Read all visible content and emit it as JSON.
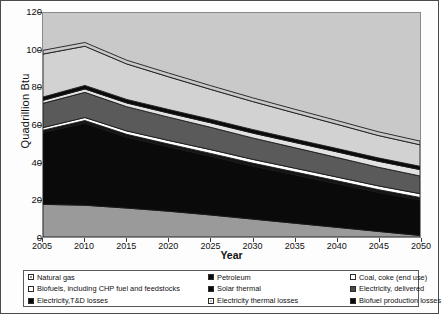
{
  "chart_data": {
    "type": "area",
    "stacked": true,
    "title": "",
    "xlabel": "Year",
    "ylabel": "Quadrillion Btu",
    "x": [
      2005,
      2010,
      2015,
      2020,
      2025,
      2030,
      2035,
      2040,
      2045,
      2050
    ],
    "xlim": [
      2005,
      2050
    ],
    "ylim": [
      0,
      120
    ],
    "ytick_values": [
      0,
      20,
      40,
      60,
      80,
      100,
      120
    ],
    "xtick_values": [
      2005,
      2010,
      2015,
      2020,
      2025,
      2030,
      2035,
      2040,
      2045,
      2050
    ],
    "grid": false,
    "legend_position": "below",
    "series": [
      {
        "name": "Natural gas",
        "color": "#9a9a9a",
        "values": [
          17.5,
          17.0,
          15.5,
          13.8,
          11.8,
          9.6,
          7.4,
          5.2,
          3.0,
          0.8
        ]
      },
      {
        "name": "Electricity,T&D losses",
        "color": "#0a0a0a",
        "values": [
          38.5,
          44.0,
          38.0,
          34.5,
          31.5,
          28.5,
          26.0,
          23.5,
          21.0,
          19.0
        ]
      },
      {
        "name": "Biofuel production losses",
        "color": "#141414",
        "values": [
          1.2,
          1.4,
          1.5,
          1.5,
          1.5,
          1.5,
          1.5,
          1.5,
          1.4,
          1.4
        ]
      },
      {
        "name": "Solar thermal",
        "color": "#ffffff",
        "values": [
          1.4,
          1.6,
          1.8,
          1.9,
          2.0,
          2.0,
          2.0,
          2.0,
          2.0,
          2.0
        ]
      },
      {
        "name": "Electricity thermal losses",
        "color": "#5a5a5a",
        "values": [
          13.0,
          13.5,
          13.0,
          12.5,
          12.0,
          11.5,
          11.0,
          10.5,
          10.0,
          9.5
        ]
      },
      {
        "name": "Biofuels, including CHP fuel and feedstocks",
        "color": "#e2e2e2",
        "values": [
          1.6,
          1.8,
          2.0,
          2.2,
          2.4,
          2.6,
          2.8,
          3.0,
          3.2,
          3.4
        ]
      },
      {
        "name": "Coal, coke (end use)",
        "color": "#0a0a0a",
        "values": [
          1.8,
          1.9,
          1.9,
          1.9,
          1.9,
          1.9,
          1.8,
          1.8,
          1.8,
          1.8
        ]
      },
      {
        "name": "Petroleum",
        "color": "#d2d2d2",
        "values": [
          23.0,
          21.0,
          19.0,
          17.5,
          16.0,
          15.0,
          14.0,
          13.0,
          12.0,
          11.5
        ]
      },
      {
        "name": "Electricity, delivered",
        "color": "#c9c9c9",
        "values": [
          2.0,
          2.0,
          2.0,
          2.0,
          2.0,
          2.0,
          2.0,
          2.0,
          2.0,
          2.0
        ]
      }
    ],
    "totals": [
      100.0,
      104.2,
      94.7,
      87.8,
      81.1,
      74.6,
      68.5,
      62.5,
      56.4,
      51.4
    ]
  },
  "legend": {
    "items": [
      {
        "label": "Natural gas",
        "swatch": "dotmid"
      },
      {
        "label": "Petroleum",
        "swatch": "solid-black"
      },
      {
        "label": "Coal, coke (end use)",
        "swatch": "white"
      },
      {
        "label": "Biofuels, including CHP fuel and feedstocks",
        "swatch": "white"
      },
      {
        "label": "Solar thermal",
        "swatch": "solid-black"
      },
      {
        "label": "Electricity, delivered",
        "swatch": "solid-dark"
      },
      {
        "label": "Electricity,T&D losses",
        "swatch": "solid-black"
      },
      {
        "label": "Electricity thermal losses",
        "swatch": "hatch"
      },
      {
        "label": "Biofuel production losses",
        "swatch": "solid-black"
      }
    ]
  }
}
